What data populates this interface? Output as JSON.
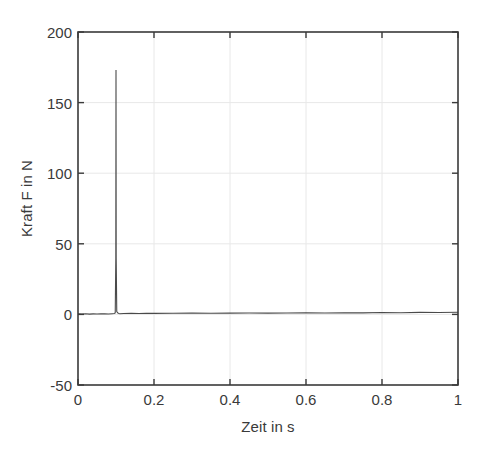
{
  "chart_data": {
    "type": "line",
    "title": "",
    "subtitle": "",
    "xlabel": "Zeit in s",
    "ylabel": "Kraft F in N",
    "xlim": [
      0,
      1
    ],
    "ylim": [
      -50,
      200
    ],
    "xticks": [
      0,
      0.2,
      0.4,
      0.6,
      0.8,
      1
    ],
    "xticklabels": [
      "0",
      "0.2",
      "0.4",
      "0.6",
      "0.8",
      "1"
    ],
    "yticks": [
      -50,
      0,
      50,
      100,
      150,
      200
    ],
    "yticklabels": [
      "-50",
      "0",
      "50",
      "100",
      "150",
      "200"
    ],
    "grid": true,
    "grid_color": "#e8e8e8",
    "legend": null,
    "line_color": "#4a4a4a",
    "line_width": 1.1,
    "background": "#ffffff",
    "axes_color": "#3a3a3a",
    "annotations": [],
    "series": [
      {
        "name": "Kraft F",
        "description": "Impulshammer-Kraftsignal: flache Nulllinie mit einem einzelnen scharfen Kraftimpuls bei t = 0.1 s",
        "peak": {
          "x": 0.1,
          "y": 173
        },
        "baseline": 0,
        "x": [
          0,
          0.01,
          0.02,
          0.03,
          0.04,
          0.05,
          0.06,
          0.07,
          0.08,
          0.09,
          0.095,
          0.098,
          0.0995,
          0.1,
          0.1005,
          0.102,
          0.105,
          0.108,
          0.11,
          0.12,
          0.14,
          0.16,
          0.18,
          0.2,
          0.25,
          0.3,
          0.35,
          0.4,
          0.45,
          0.5,
          0.55,
          0.6,
          0.65,
          0.7,
          0.75,
          0.8,
          0.85,
          0.9,
          0.95,
          1.0
        ],
        "y": [
          0.4,
          0.3,
          0.5,
          0.2,
          0.4,
          0.3,
          0.5,
          0.4,
          0.3,
          0.5,
          0.6,
          1.0,
          40,
          173,
          40,
          2.0,
          0.9,
          0.6,
          0.5,
          0.6,
          0.7,
          0.6,
          0.8,
          0.7,
          0.8,
          0.9,
          0.8,
          0.9,
          1.0,
          0.9,
          1.0,
          1.1,
          1.0,
          1.2,
          1.1,
          1.3,
          1.2,
          1.4,
          1.3,
          1.5
        ]
      }
    ]
  },
  "figure": {
    "plot_area": {
      "left": 78,
      "top": 32,
      "right": 458,
      "bottom": 385
    }
  }
}
